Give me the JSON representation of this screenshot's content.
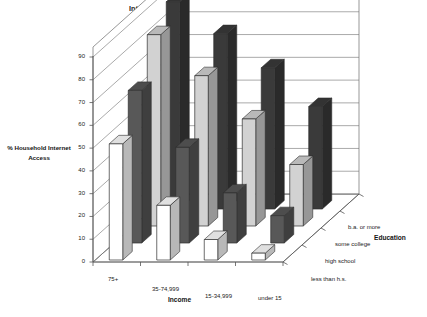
{
  "chart_data": {
    "type": "bar",
    "title": "Internet Access by Income and Education, 2000",
    "xlabel": "Income",
    "ylabel": "% Household Internet Access",
    "zlabel": "Education",
    "ylim": [
      0,
      90
    ],
    "yticks": [
      0,
      10,
      20,
      30,
      40,
      50,
      60,
      70,
      80,
      90
    ],
    "grid": true,
    "legend": "none",
    "projection": "3d",
    "categories": [
      "75+",
      "35-74,999",
      "15-34,999",
      "under 15"
    ],
    "series": [
      {
        "name": "less than h.s.",
        "color": "#ffffff",
        "values": [
          51,
          24,
          9,
          3
        ]
      },
      {
        "name": "high school",
        "color": "#585858",
        "values": [
          67,
          42,
          22,
          12
        ]
      },
      {
        "name": "some college",
        "color": "#d2d2d2",
        "values": [
          84,
          66,
          47,
          27
        ]
      },
      {
        "name": "b.a. or more",
        "color": "#3a3a3a",
        "values": [
          91,
          77,
          62,
          45
        ]
      }
    ]
  },
  "axes": {
    "y_ticks": [
      "90",
      "80",
      "70",
      "60",
      "50",
      "40",
      "30",
      "20",
      "10",
      "0"
    ],
    "x_categories": [
      "75+",
      "35-74,999",
      "15-34,999",
      "under 15"
    ],
    "z_categories": [
      "b.a. or more",
      "some college",
      "high school",
      "less than h.s."
    ],
    "x_title": "Income",
    "z_title": "Education",
    "y_title_line1": "% Household Internet",
    "y_title_line2": "Access"
  },
  "title": "Internet Access by Income and Education, 2000"
}
